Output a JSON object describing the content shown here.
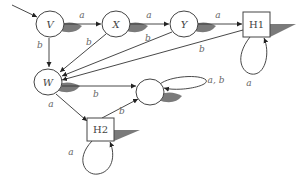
{
  "diagram": {
    "type": "state-transition-automaton",
    "nodes": {
      "V": {
        "label": "V",
        "shape": "circle",
        "initial": true
      },
      "X": {
        "label": "X",
        "shape": "circle"
      },
      "Y": {
        "label": "Y",
        "shape": "circle"
      },
      "H1": {
        "label": "H1",
        "shape": "box"
      },
      "W": {
        "label": "W",
        "shape": "circle"
      },
      "S": {
        "label": "",
        "shape": "circle"
      },
      "H2": {
        "label": "H2",
        "shape": "box"
      }
    },
    "edges": [
      {
        "from": "V",
        "to": "X",
        "label": "a"
      },
      {
        "from": "X",
        "to": "Y",
        "label": "a"
      },
      {
        "from": "Y",
        "to": "H1",
        "label": "a"
      },
      {
        "from": "V",
        "to": "W",
        "label": "b"
      },
      {
        "from": "X",
        "to": "W",
        "label": "b"
      },
      {
        "from": "Y",
        "to": "W",
        "label": "b"
      },
      {
        "from": "H1",
        "to": "W",
        "label": "b"
      },
      {
        "from": "H1",
        "to": "H1",
        "label": "a"
      },
      {
        "from": "W",
        "to": "S",
        "label": "b"
      },
      {
        "from": "W",
        "to": "H2",
        "label": "a"
      },
      {
        "from": "H2",
        "to": "S",
        "label": "b"
      },
      {
        "from": "H2",
        "to": "H2",
        "label": "a"
      },
      {
        "from": "S",
        "to": "S",
        "label": "a, b"
      }
    ]
  }
}
